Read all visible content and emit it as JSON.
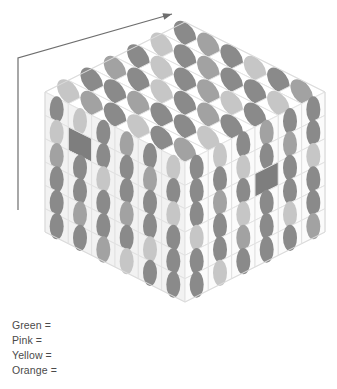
{
  "figure": {
    "title": "",
    "background_color": "#ffffff",
    "canvas": {
      "width": 337,
      "height": 389
    }
  },
  "arrow": {
    "name": "direction-arrow",
    "color": "#6e6e6e",
    "stroke_width": 1.2,
    "path_points": [
      {
        "x": 18,
        "y": 210
      },
      {
        "x": 18,
        "y": 58
      },
      {
        "x": 172,
        "y": 14
      }
    ],
    "arrowhead_at": {
      "x": 172,
      "y": 14
    }
  },
  "cube": {
    "name": "isometric-cube",
    "grid_size": 6,
    "projection": "isometric",
    "geometry": {
      "top_apex": {
        "x": 185,
        "y": 22
      },
      "left_corner": {
        "x": 45,
        "y": 92
      },
      "right_corner": {
        "x": 325,
        "y": 92
      },
      "front_top": {
        "x": 185,
        "y": 162
      },
      "left_bottom": {
        "x": 45,
        "y": 232
      },
      "right_bottom": {
        "x": 325,
        "y": 232
      },
      "front_bottom": {
        "x": 185,
        "y": 302
      }
    },
    "face_colors": {
      "top": "#ffffff",
      "left": "#f2f2f2",
      "right": "#fbfbfb",
      "cell_border": "#e2e2e2"
    },
    "dot_palette": {
      "dark": "#8a8a8a",
      "medium": "#a2a2a2",
      "light": "#c6c6c6",
      "pale": "#d8d8d8"
    },
    "blank_cell_color": "#7e7e7e",
    "faces": {
      "top": {
        "name": "top-face",
        "rows": [
          [
            "dark",
            "light",
            "dark",
            "medium",
            "dark",
            "light"
          ],
          [
            "medium",
            "dark",
            "light",
            "dark",
            "dark",
            "medium"
          ],
          [
            "dark",
            "medium",
            "dark",
            "light",
            "medium",
            "dark"
          ],
          [
            "light",
            "dark",
            "medium",
            "dark",
            "dark",
            "light"
          ],
          [
            "dark",
            "dark",
            "light",
            "medium",
            "dark",
            "dark"
          ],
          [
            "medium",
            "light",
            "dark",
            "dark",
            "light",
            "medium"
          ]
        ]
      },
      "left": {
        "name": "left-face",
        "rows": [
          [
            "dark",
            "light",
            "dark",
            "medium",
            "dark",
            "light"
          ],
          [
            "light",
            "blank",
            "dark",
            "dark",
            "medium",
            "dark"
          ],
          [
            "medium",
            "dark",
            "light",
            "dark",
            "dark",
            "light"
          ],
          [
            "dark",
            "dark",
            "dark",
            "medium",
            "dark",
            "dark"
          ],
          [
            "dark",
            "medium",
            "dark",
            "dark",
            "light",
            "dark"
          ],
          [
            "dark",
            "dark",
            "medium",
            "light",
            "dark",
            "dark"
          ]
        ]
      },
      "right": {
        "name": "right-face",
        "rows": [
          [
            "dark",
            "light",
            "dark",
            "medium",
            "dark",
            "dark"
          ],
          [
            "dark",
            "dark",
            "light",
            "dark",
            "medium",
            "dark"
          ],
          [
            "dark",
            "medium",
            "dark",
            "blank",
            "dark",
            "light"
          ],
          [
            "light",
            "dark",
            "light",
            "dark",
            "dark",
            "dark"
          ],
          [
            "dark",
            "dark",
            "medium",
            "dark",
            "light",
            "dark"
          ],
          [
            "dark",
            "light",
            "dark",
            "dark",
            "dark",
            "medium"
          ]
        ]
      }
    }
  },
  "legend": {
    "name": "color-legend",
    "items": [
      {
        "label": "Green",
        "equals": "=",
        "value": ""
      },
      {
        "label": "Pink",
        "equals": "=",
        "value": ""
      },
      {
        "label": "Yellow",
        "equals": "=",
        "value": ""
      },
      {
        "label": "Orange",
        "equals": "=",
        "value": ""
      }
    ],
    "text_color": "#4a4a4a"
  }
}
